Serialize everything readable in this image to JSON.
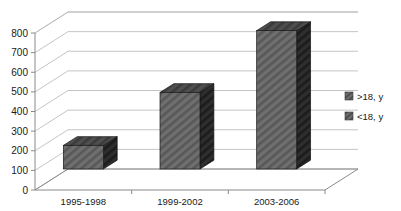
{
  "chart_data": {
    "type": "bar",
    "title": "",
    "subtitle": "",
    "xlabel": "",
    "ylabel": "",
    "categories": [
      "1995-1998",
      "1999-2002",
      "2003-2006"
    ],
    "values": [
      120,
      390,
      705
    ],
    "series": [
      {
        "name": "<18, y",
        "values": [
          120,
          390,
          705
        ]
      }
    ],
    "ylim": [
      0,
      800
    ],
    "yticks": [
      0,
      100,
      200,
      300,
      400,
      500,
      600,
      700,
      800
    ],
    "ytick_labels": [
      "0",
      "100",
      "200",
      "300",
      "400",
      "500",
      "600",
      "700",
      "800"
    ],
    "grid": true,
    "three_d": true,
    "legend_position": "right",
    "legend": [
      {
        "label": ">18, y",
        "color": "#4d4d4d"
      },
      {
        "label": "<18, y",
        "color": "#5e5e5e"
      }
    ],
    "annotations": []
  },
  "style": {
    "bar_front_color": "#6b6b6b",
    "bar_side_color": "#2b2b2b",
    "bar_top_color": "#4a4a4a",
    "grid_color": "#b5b5b5",
    "axis_color": "#8a8a8a",
    "text_color": "#1a1a1a",
    "background": "#ffffff"
  }
}
